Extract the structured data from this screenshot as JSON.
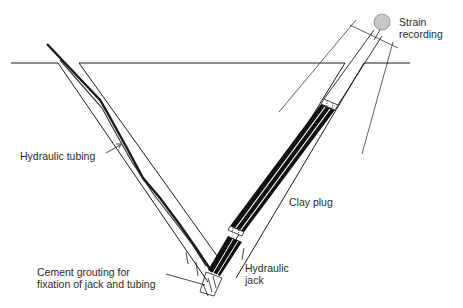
{
  "diagram": {
    "type": "borehole-jack-cross-section",
    "labels": {
      "strain_recording": "Strain\nrecording",
      "hydraulic_tubing": "Hydraulic tubing",
      "clay_plug": "Clay plug",
      "hydraulic_jack": "Hydraulic\njack",
      "cement_grouting": "Cement grouting for\nfixation of jack and tubing"
    },
    "colors": {
      "line": "#1a1a1a",
      "gauge_fill": "#c8c8c8",
      "gauge_stroke": "#888888",
      "text": "#2a2a2a"
    }
  }
}
